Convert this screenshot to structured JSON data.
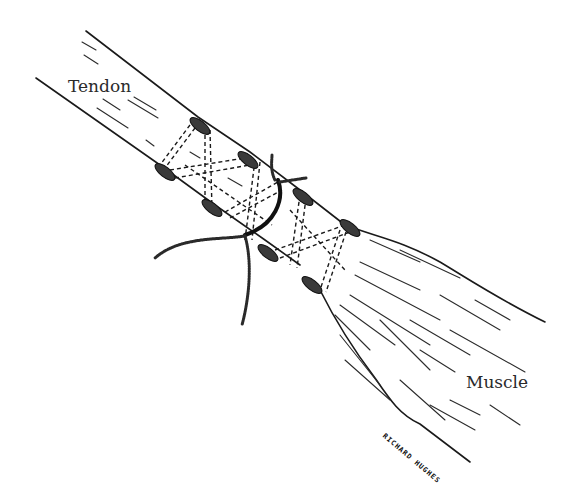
{
  "figure": {
    "labels": {
      "tendon": "Tendon",
      "muscle": "Muscle"
    },
    "signature": "RICHARD HUGHES"
  }
}
